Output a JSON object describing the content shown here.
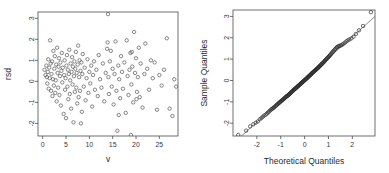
{
  "figure": {
    "layout": "two-panel-row",
    "background": "#ffffff",
    "point_color": "#555555",
    "axis_color": "#4d4d4d",
    "line_color": "#5a5a5a"
  },
  "chart_data": [
    {
      "type": "scatter",
      "panel": "left",
      "title": "",
      "xlabel": "v",
      "ylabel": "rsd",
      "xlim": [
        -1.0,
        29.0
      ],
      "ylim": [
        -2.6,
        3.3
      ],
      "xticks": [
        0,
        5,
        10,
        15,
        20,
        25
      ],
      "yticks": [
        -2,
        -1,
        0,
        1,
        2,
        3
      ],
      "grid": false,
      "legend": null,
      "marker": "open-circle",
      "x": [
        0.4,
        0.6,
        0.8,
        0.9,
        1.0,
        1.1,
        1.2,
        1.3,
        1.4,
        1.5,
        1.6,
        1.7,
        1.8,
        1.9,
        2.0,
        2.1,
        2.2,
        2.3,
        2.4,
        2.5,
        2.6,
        2.7,
        2.8,
        2.9,
        3.0,
        3.1,
        3.2,
        3.3,
        3.4,
        3.5,
        3.6,
        3.7,
        3.8,
        3.9,
        4.0,
        4.1,
        4.2,
        4.3,
        4.5,
        4.6,
        4.7,
        4.8,
        4.9,
        5.0,
        5.1,
        5.2,
        5.3,
        5.4,
        5.5,
        5.6,
        5.7,
        5.8,
        5.9,
        6.0,
        6.1,
        6.2,
        6.3,
        6.4,
        6.5,
        6.6,
        6.7,
        6.8,
        6.9,
        7.0,
        7.1,
        7.2,
        7.3,
        7.4,
        7.5,
        7.6,
        7.7,
        7.8,
        7.9,
        8.0,
        8.1,
        8.2,
        8.3,
        8.4,
        8.5,
        8.6,
        8.8,
        9.0,
        9.2,
        9.4,
        9.6,
        9.8,
        10.0,
        10.2,
        10.4,
        10.6,
        10.8,
        11.0,
        11.2,
        11.5,
        11.8,
        12.0,
        12.3,
        12.6,
        12.9,
        13.2,
        13.5,
        13.8,
        14.0,
        14.1,
        14.2,
        14.4,
        14.6,
        14.8,
        15.0,
        15.2,
        15.4,
        15.6,
        15.8,
        16.0,
        16.2,
        16.4,
        16.6,
        16.8,
        17.0,
        17.2,
        17.5,
        17.8,
        18.0,
        18.2,
        18.4,
        18.6,
        18.8,
        19.0,
        19.2,
        19.4,
        19.6,
        19.8,
        20.0,
        20.2,
        20.4,
        20.6,
        20.8,
        21.0,
        21.4,
        21.8,
        22.0,
        22.4,
        22.8,
        23.2,
        23.6,
        24.0,
        24.5,
        25.0,
        25.5,
        26.0,
        26.6,
        27.2,
        27.8,
        28.2,
        28.6,
        13.9,
        16.3,
        18.9,
        19.1,
        20.1
      ],
      "y": [
        0.55,
        0.3,
        0.75,
        0.2,
        -0.1,
        0.45,
        1.05,
        -0.35,
        0.65,
        0.15,
        1.95,
        0.85,
        -0.45,
        0.35,
        0.95,
        -0.7,
        0.1,
        1.45,
        -0.2,
        0.6,
        1.2,
        -0.55,
        0.05,
        0.8,
        -0.95,
        1.6,
        0.4,
        -0.3,
        0.7,
        1.1,
        -0.65,
        0.25,
        0.9,
        -1.15,
        0.5,
        1.35,
        -0.05,
        0.65,
        -1.55,
        0.3,
        1.0,
        -0.4,
        0.15,
        -1.75,
        0.75,
        1.25,
        -0.25,
        0.55,
        -0.85,
        0.35,
        1.5,
        -0.6,
        0.05,
        0.85,
        -1.3,
        0.45,
        1.15,
        -0.15,
        0.7,
        -1.95,
        0.25,
        0.95,
        -0.5,
        0.6,
        1.4,
        -0.3,
        0.4,
        -1.05,
        0.8,
        1.7,
        -0.75,
        0.2,
        1.0,
        -0.45,
        0.5,
        -2.0,
        0.9,
        -1.45,
        0.35,
        1.3,
        -0.25,
        0.65,
        -0.9,
        0.15,
        1.05,
        -0.55,
        0.45,
        -0.1,
        0.75,
        -1.2,
        0.3,
        0.95,
        -0.4,
        0.55,
        -0.7,
        1.25,
        0.1,
        -0.3,
        0.85,
        -0.95,
        0.4,
        1.55,
        3.2,
        0.2,
        -0.6,
        0.95,
        1.45,
        -0.25,
        0.6,
        -1.1,
        0.35,
        1.9,
        -0.45,
        -2.35,
        0.75,
        0.1,
        -0.8,
        1.2,
        0.45,
        -0.35,
        0.9,
        -1.5,
        1.95,
        0.25,
        -0.65,
        0.55,
        1.35,
        -0.15,
        0.7,
        -1.0,
        2.35,
        0.4,
        1.1,
        -0.5,
        0.2,
        1.6,
        -0.75,
        0.85,
        -1.25,
        0.35,
        1.8,
        0.6,
        -0.4,
        1.0,
        0.15,
        0.9,
        -1.35,
        0.3,
        -0.2,
        0.55,
        2.05,
        -1.3,
        -1.65,
        0.1,
        -0.25,
        1.85,
        -1.6,
        -2.55,
        1.4,
        -0.85
      ]
    },
    {
      "type": "scatter",
      "panel": "right",
      "title": "",
      "xlabel": "Theoretical Quantiles",
      "ylabel": "Sample Quantiles",
      "xlim": [
        -3.0,
        2.95
      ],
      "ylim": [
        -2.6,
        3.3
      ],
      "xticks": [
        -2,
        -1,
        0,
        1,
        2
      ],
      "yticks": [
        -2,
        -1,
        0,
        1,
        2,
        3
      ],
      "grid": false,
      "legend": null,
      "marker": "open-circle",
      "reference_line": {
        "slope": 1.0,
        "intercept": 0.05
      },
      "x": [
        -2.78,
        -2.45,
        -2.28,
        -2.15,
        -2.05,
        -1.96,
        -1.88,
        -1.81,
        -1.75,
        -1.69,
        -1.63,
        -1.58,
        -1.53,
        -1.49,
        -1.44,
        -1.4,
        -1.36,
        -1.33,
        -1.29,
        -1.26,
        -1.22,
        -1.19,
        -1.16,
        -1.13,
        -1.1,
        -1.07,
        -1.04,
        -1.02,
        -0.99,
        -0.96,
        -0.94,
        -0.91,
        -0.89,
        -0.86,
        -0.84,
        -0.82,
        -0.79,
        -0.77,
        -0.75,
        -0.73,
        -0.7,
        -0.68,
        -0.66,
        -0.64,
        -0.62,
        -0.6,
        -0.58,
        -0.56,
        -0.54,
        -0.52,
        -0.5,
        -0.48,
        -0.46,
        -0.44,
        -0.42,
        -0.4,
        -0.38,
        -0.36,
        -0.34,
        -0.32,
        -0.3,
        -0.28,
        -0.27,
        -0.25,
        -0.23,
        -0.21,
        -0.19,
        -0.17,
        -0.15,
        -0.13,
        -0.12,
        -0.1,
        -0.08,
        -0.06,
        -0.04,
        -0.02,
        0.0,
        0.02,
        0.04,
        0.06,
        0.08,
        0.1,
        0.12,
        0.13,
        0.15,
        0.17,
        0.19,
        0.21,
        0.23,
        0.25,
        0.27,
        0.28,
        0.3,
        0.32,
        0.34,
        0.36,
        0.38,
        0.4,
        0.42,
        0.44,
        0.46,
        0.48,
        0.5,
        0.52,
        0.54,
        0.56,
        0.58,
        0.6,
        0.62,
        0.64,
        0.66,
        0.68,
        0.7,
        0.73,
        0.75,
        0.77,
        0.79,
        0.82,
        0.84,
        0.86,
        0.89,
        0.91,
        0.94,
        0.96,
        0.99,
        1.02,
        1.04,
        1.07,
        1.1,
        1.13,
        1.16,
        1.19,
        1.22,
        1.26,
        1.29,
        1.33,
        1.36,
        1.4,
        1.44,
        1.49,
        1.53,
        1.58,
        1.63,
        1.69,
        1.75,
        1.81,
        1.88,
        1.96,
        2.05,
        2.15,
        2.28,
        2.45,
        2.78
      ],
      "y": [
        -2.55,
        -2.35,
        -2.15,
        -2.05,
        -1.98,
        -1.92,
        -1.82,
        -1.76,
        -1.7,
        -1.64,
        -1.6,
        -1.55,
        -1.5,
        -1.45,
        -1.4,
        -1.36,
        -1.33,
        -1.3,
        -1.27,
        -1.24,
        -1.2,
        -1.17,
        -1.14,
        -1.11,
        -1.08,
        -1.05,
        -1.02,
        -1.0,
        -0.97,
        -0.95,
        -0.92,
        -0.9,
        -0.88,
        -0.85,
        -0.83,
        -0.81,
        -0.78,
        -0.76,
        -0.74,
        -0.72,
        -0.7,
        -0.68,
        -0.66,
        -0.64,
        -0.62,
        -0.6,
        -0.58,
        -0.55,
        -0.53,
        -0.51,
        -0.49,
        -0.47,
        -0.45,
        -0.43,
        -0.41,
        -0.39,
        -0.37,
        -0.35,
        -0.33,
        -0.31,
        -0.29,
        -0.27,
        -0.26,
        -0.24,
        -0.22,
        -0.2,
        -0.18,
        -0.16,
        -0.14,
        -0.12,
        -0.1,
        -0.09,
        -0.07,
        -0.05,
        -0.03,
        -0.01,
        0.01,
        0.03,
        0.05,
        0.07,
        0.09,
        0.11,
        0.13,
        0.15,
        0.17,
        0.19,
        0.21,
        0.23,
        0.25,
        0.27,
        0.29,
        0.31,
        0.33,
        0.35,
        0.37,
        0.39,
        0.41,
        0.43,
        0.45,
        0.47,
        0.49,
        0.51,
        0.53,
        0.55,
        0.57,
        0.59,
        0.62,
        0.64,
        0.66,
        0.68,
        0.7,
        0.73,
        0.75,
        0.78,
        0.8,
        0.83,
        0.85,
        0.88,
        0.91,
        0.94,
        0.97,
        1.0,
        1.03,
        1.06,
        1.09,
        1.12,
        1.15,
        1.19,
        1.23,
        1.27,
        1.31,
        1.35,
        1.39,
        1.44,
        1.48,
        1.53,
        1.56,
        1.59,
        1.61,
        1.63,
        1.65,
        1.68,
        1.72,
        1.77,
        1.83,
        1.88,
        1.92,
        1.97,
        2.05,
        2.18,
        2.35,
        2.55,
        3.2
      ]
    }
  ]
}
